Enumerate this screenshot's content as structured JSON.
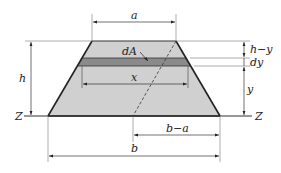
{
  "diagram": {
    "type": "trapezoid-cross-section",
    "labels": {
      "a": "a",
      "b": "b",
      "h": "h",
      "x": "x",
      "y": "y",
      "dy": "dy",
      "h_minus_y": "h−y",
      "b_minus_a": "b−a",
      "dA": "dA",
      "z_left": "Z",
      "z_right": "Z"
    },
    "colors": {
      "fill": "#d0d0d0",
      "strip": "#8a8a8a",
      "outline": "#222222",
      "dim_line": "#333333",
      "ext_line": "#777777"
    }
  }
}
